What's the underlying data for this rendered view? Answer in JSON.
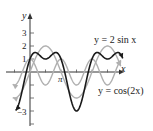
{
  "chart_data": {
    "type": "line",
    "title": "",
    "xlabel": "x",
    "ylabel": "y",
    "x_tick_labels": [
      "π"
    ],
    "y_tick_labels": [
      "1",
      "2",
      "3",
      "-3"
    ],
    "xlim": [
      -2.0,
      10.5
    ],
    "ylim": [
      -3.5,
      4.0
    ],
    "grid": false,
    "series": [
      {
        "name": "y = 2 sin x",
        "expr": "2*sin(x)",
        "style": "light gray",
        "color": "#b0b0b0"
      },
      {
        "name": "y = cos(2x)",
        "expr": "cos(2*x)",
        "style": "light gray",
        "color": "#b0b0b0"
      },
      {
        "name": "y = 2 sin x + cos(2x)",
        "expr": "2*sin(x)+cos(2*x)",
        "style": "black",
        "color": "#1a1a1a"
      }
    ],
    "annotations": [
      {
        "text": "y = 2 sin x",
        "points_to": "y = 2 sin x"
      },
      {
        "text": "y = cos(2x)",
        "points_to": "y = cos(2x)"
      }
    ]
  },
  "labels": {
    "y_axis": "y",
    "x_axis": "x",
    "pi": "π",
    "t3": "3",
    "t2": "2",
    "t1": "1",
    "tm3": "−3",
    "sin_label": "y = 2 sin x",
    "cos_label": "y = cos(2x)"
  }
}
